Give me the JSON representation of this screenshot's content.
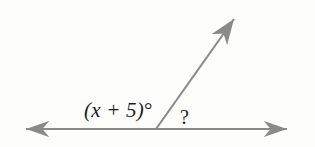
{
  "figure": {
    "background_color": "#fdfdfc",
    "stroke_color": "#8a8a8a",
    "text_color": "#1c1c1c",
    "labels": {
      "angle_expression": "(x + 5)",
      "angle_expression_degree": "°",
      "unknown_angle": "?"
    },
    "geometry": {
      "line_label": "horizontal-line",
      "line_start_x": 18,
      "line_start_y": 129,
      "line_end_x": 295,
      "line_end_y": 129,
      "vertex_x": 156,
      "vertex_y": 129,
      "ray_tip_x": 240,
      "ray_tip_y": 11
    }
  }
}
